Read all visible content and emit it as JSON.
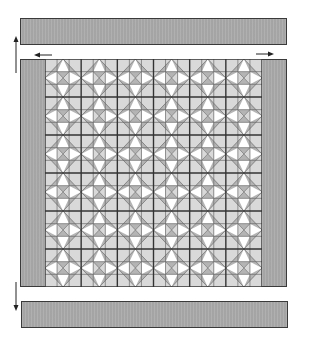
{
  "diagram": {
    "title": "",
    "colors": {
      "border_fill": "#ababab",
      "border_outline": "#3a3a3a",
      "light": "#d9d9d9",
      "medium": "#b4b4b4",
      "white": "#ffffff",
      "grid_line": "#6a6a6a",
      "block_line": "#333333",
      "arrow": "#222222"
    },
    "top_border": {
      "label": "top-border-strip"
    },
    "bottom_border": {
      "label": "bottom-border-strip"
    },
    "side_borders": {
      "left": "left-border-strip",
      "right": "right-border-strip"
    },
    "center": {
      "block_rows": 6,
      "block_cols": 6,
      "cells_per_block": 3
    },
    "arrows": [
      {
        "name": "up-arrow",
        "direction": "up"
      },
      {
        "name": "left-arrow",
        "direction": "left"
      },
      {
        "name": "right-arrow",
        "direction": "right"
      },
      {
        "name": "down-arrow",
        "direction": "down"
      }
    ]
  }
}
